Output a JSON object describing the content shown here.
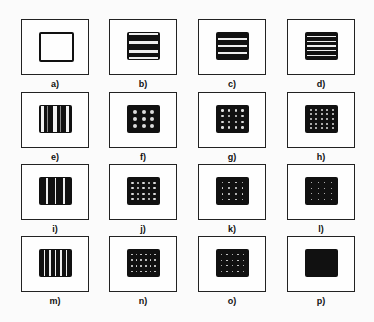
{
  "figure": {
    "rows": 4,
    "cols": 4,
    "panels": [
      {
        "id": "a",
        "label": "a)",
        "pattern": "hollow"
      },
      {
        "id": "b",
        "label": "b)",
        "pattern": "hlines",
        "count": 2
      },
      {
        "id": "c",
        "label": "c)",
        "pattern": "hlines",
        "count": 3
      },
      {
        "id": "d",
        "label": "d)",
        "pattern": "hlines",
        "count": 5
      },
      {
        "id": "e",
        "label": "e)",
        "pattern": "vbands",
        "count": 2
      },
      {
        "id": "f",
        "label": "f)",
        "pattern": "dots",
        "cols": 3,
        "rows": 3,
        "size": 4
      },
      {
        "id": "g",
        "label": "g)",
        "pattern": "dots",
        "cols": 4,
        "rows": 4,
        "size": 2.6
      },
      {
        "id": "h",
        "label": "h)",
        "pattern": "dots",
        "cols": 5,
        "rows": 5,
        "size": 2
      },
      {
        "id": "i",
        "label": "i)",
        "pattern": "vlines",
        "count": 3
      },
      {
        "id": "j",
        "label": "j)",
        "pattern": "dots",
        "cols": 5,
        "rows": 4,
        "size": 2.2
      },
      {
        "id": "k",
        "label": "k)",
        "pattern": "dots",
        "cols": 4,
        "rows": 4,
        "size": 1.8
      },
      {
        "id": "l",
        "label": "l)",
        "pattern": "dots",
        "cols": 4,
        "rows": 4,
        "size": 1.2
      },
      {
        "id": "m",
        "label": "m)",
        "pattern": "vlines",
        "count": 5
      },
      {
        "id": "n",
        "label": "n)",
        "pattern": "dots",
        "cols": 6,
        "rows": 4,
        "size": 1.6
      },
      {
        "id": "o",
        "label": "o)",
        "pattern": "dots",
        "cols": 5,
        "rows": 4,
        "size": 1.2
      },
      {
        "id": "p",
        "label": "p)",
        "pattern": "solid"
      }
    ]
  }
}
